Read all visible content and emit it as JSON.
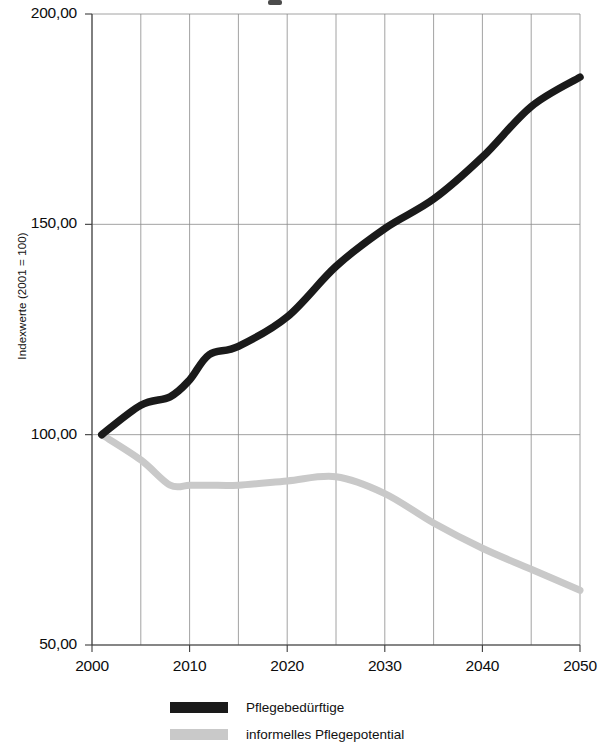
{
  "chart_data": {
    "type": "line",
    "title": "",
    "xlabel": "",
    "ylabel": "Indexwerte (2001 = 100)",
    "xlim": [
      2000,
      2050
    ],
    "ylim": [
      50,
      200
    ],
    "grid": true,
    "legend_position": "bottom",
    "y_ticks": [
      "50,00",
      "100,00",
      "150,00",
      "200,00"
    ],
    "y_tick_values": [
      50,
      100,
      150,
      200
    ],
    "x_ticks": [
      "2000",
      "2010",
      "2020",
      "2030",
      "2040",
      "2050"
    ],
    "x_tick_values": [
      2000,
      2010,
      2020,
      2030,
      2040,
      2050
    ],
    "x_minor_gridlines": [
      2005,
      2015,
      2025,
      2035,
      2045
    ],
    "x": [
      2001,
      2005,
      2008,
      2010,
      2012,
      2015,
      2020,
      2025,
      2030,
      2035,
      2040,
      2045,
      2050
    ],
    "series": [
      {
        "name": "Pflegebedürftige",
        "color": "#1a1a1a",
        "values": [
          100,
          107,
          109,
          113,
          119,
          121,
          128,
          140,
          149,
          156,
          166,
          178,
          185
        ]
      },
      {
        "name": "informelles Pflegepotential",
        "color": "#c9c9c9",
        "values": [
          100,
          94,
          88,
          88,
          88,
          88,
          89,
          90,
          86,
          79,
          73,
          68,
          63
        ]
      }
    ]
  },
  "legend": {
    "items": [
      {
        "label": "Pflegebedürftige",
        "color": "#1a1a1a"
      },
      {
        "label": "informelles Pflegepotential",
        "color": "#c9c9c9"
      }
    ]
  },
  "colors": {
    "series_black": "#1a1a1a",
    "series_gray": "#c9c9c9",
    "grid": "#8a8a8a",
    "axis": "#3d3d3d",
    "text": "#0d0d0d",
    "background": "#ffffff"
  }
}
